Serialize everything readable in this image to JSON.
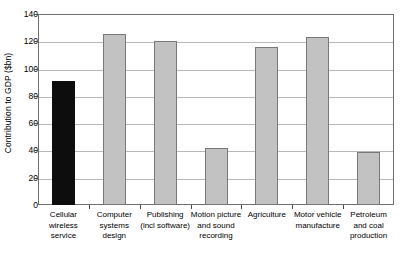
{
  "chart_data": {
    "type": "bar",
    "title": "",
    "xlabel": "",
    "ylabel": "Contribution to GDP ($bn)",
    "ylim": [
      0,
      140
    ],
    "ytick_values": [
      0,
      20,
      40,
      60,
      80,
      100,
      120,
      140
    ],
    "ytick_labels": [
      "0",
      "20",
      "40",
      "60",
      "80",
      "100",
      "120",
      "140"
    ],
    "grid": true,
    "legend": "none",
    "categories": [
      "Cellular wireless service",
      "Computer systems design",
      "Publishing (incl software)",
      "Motion picture and sound recording",
      "Agriculture",
      "Motor vehicle manufacture",
      "Petroleum and coal production"
    ],
    "category_lines": [
      [
        "Cellular",
        "wireless",
        "service"
      ],
      [
        "Computer",
        "systems",
        "design"
      ],
      [
        "Publishing",
        "(incl software)"
      ],
      [
        "Motion picture",
        "and sound",
        "recording"
      ],
      [
        "Agriculture"
      ],
      [
        "Motor vehicle",
        "manufacture"
      ],
      [
        "Petroleum",
        "and coal",
        "production"
      ]
    ],
    "values": [
      91,
      125,
      120,
      42,
      116,
      123,
      39
    ],
    "bar_colors": [
      "#0d0d0d",
      "#c2c2c2",
      "#c2c2c2",
      "#c2c2c2",
      "#c2c2c2",
      "#c2c2c2",
      "#c2c2c2"
    ],
    "highlight_index": 0,
    "colors": {
      "bar_gray_fill": "#c2c2c2",
      "bar_gray_border": "#787878",
      "bar_black_fill": "#0d0d0d",
      "gridline": "#b9b9b9",
      "axis": "#6f6f6f",
      "background": "#ffffff",
      "text": "#000000"
    }
  }
}
